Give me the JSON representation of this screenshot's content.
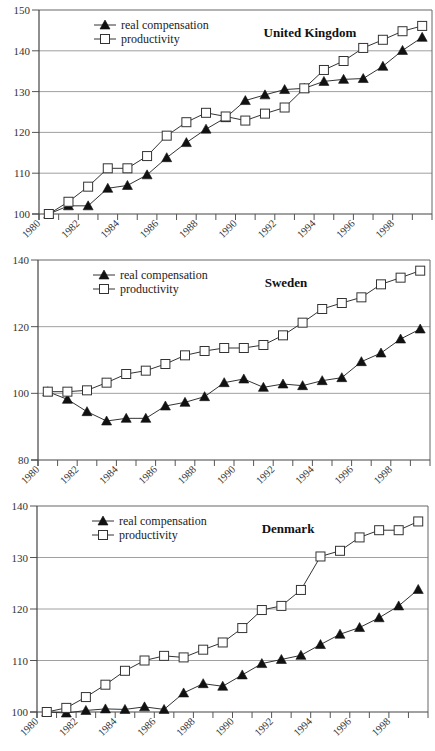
{
  "chart_data": [
    {
      "type": "line",
      "title": "United Kingdom",
      "xlabel": "",
      "ylabel": "",
      "ylim": [
        100,
        150
      ],
      "yticks": [
        100,
        110,
        120,
        130,
        140,
        150
      ],
      "xticks": [
        "1980",
        "1982",
        "1984",
        "1986",
        "1988",
        "1990",
        "1992",
        "1994",
        "1996",
        "1998"
      ],
      "grid": "horizontal",
      "legend_position": "top-left",
      "x": [
        1980,
        1981,
        1982,
        1983,
        1984,
        1985,
        1986,
        1987,
        1988,
        1989,
        1990,
        1991,
        1992,
        1993,
        1994,
        1995,
        1996,
        1997,
        1998,
        1999
      ],
      "series": [
        {
          "name": "real compensation",
          "marker": "filled-triangle",
          "values": [
            100,
            102,
            102,
            106.3,
            107,
            109.6,
            113.8,
            117.5,
            120.8,
            123.6,
            127.8,
            129.2,
            130.5,
            130.8,
            132.5,
            133,
            133.2,
            136.2,
            140.1,
            143.3
          ]
        },
        {
          "name": "productivity",
          "marker": "open-square",
          "values": [
            100,
            103,
            106.7,
            111.2,
            111.2,
            114.2,
            119.2,
            122.5,
            124.8,
            123.9,
            122.9,
            124.6,
            126.1,
            130.8,
            135.3,
            137.5,
            140.7,
            142.7,
            144.8,
            146.1
          ]
        }
      ]
    },
    {
      "type": "line",
      "title": "Sweden",
      "xlabel": "",
      "ylabel": "",
      "ylim": [
        80,
        140
      ],
      "yticks": [
        80,
        100,
        120,
        140
      ],
      "xticks": [
        "1980",
        "1982",
        "1984",
        "1986",
        "1988",
        "1990",
        "1992",
        "1994",
        "1996",
        "1998"
      ],
      "grid": "horizontal",
      "legend_position": "top-left",
      "x": [
        1980,
        1981,
        1982,
        1983,
        1984,
        1985,
        1986,
        1987,
        1988,
        1989,
        1990,
        1991,
        1992,
        1993,
        1994,
        1995,
        1996,
        1997,
        1998,
        1999
      ],
      "series": [
        {
          "name": "real compensation",
          "marker": "filled-triangle",
          "values": [
            100.5,
            98.2,
            94.5,
            91.7,
            92.5,
            92.5,
            96.2,
            97.3,
            99,
            103.2,
            104.3,
            101.8,
            102.8,
            102.3,
            103.8,
            104.7,
            109.5,
            112.1,
            116.3,
            119.3
          ]
        },
        {
          "name": "productivity",
          "marker": "open-square",
          "values": [
            100.5,
            100.5,
            100.9,
            103.2,
            105.8,
            106.8,
            108.8,
            111.4,
            112.7,
            113.6,
            113.6,
            114.5,
            117.4,
            121.2,
            125.3,
            127.1,
            128.8,
            132.7,
            134.7,
            136.8
          ]
        }
      ]
    },
    {
      "type": "line",
      "title": "Denmark",
      "xlabel": "",
      "ylabel": "",
      "ylim": [
        100,
        140
      ],
      "yticks": [
        100,
        110,
        120,
        130,
        140
      ],
      "xticks": [
        "1980",
        "1982",
        "1984",
        "1986",
        "1988",
        "1990",
        "1992",
        "1994",
        "1996",
        "1998"
      ],
      "grid": "horizontal",
      "legend_position": "top-left",
      "x": [
        1980,
        1981,
        1982,
        1983,
        1984,
        1985,
        1986,
        1987,
        1988,
        1989,
        1990,
        1991,
        1992,
        1993,
        1994,
        1995,
        1996,
        1997,
        1998,
        1999
      ],
      "series": [
        {
          "name": "real compensation",
          "marker": "filled-triangle",
          "values": [
            100,
            99.8,
            100.3,
            100.6,
            100.5,
            101,
            100.5,
            103.7,
            105.5,
            105,
            107.2,
            109.4,
            110.2,
            111,
            113.1,
            115.1,
            116.4,
            118.3,
            120.6,
            123.8
          ]
        },
        {
          "name": "productivity",
          "marker": "open-square",
          "values": [
            100,
            100.8,
            102.9,
            105.3,
            108,
            110,
            110.9,
            110.6,
            112.1,
            113.5,
            116.3,
            119.8,
            120.6,
            123.7,
            130.2,
            131.3,
            133.9,
            135.3,
            135.3,
            137
          ]
        }
      ]
    }
  ]
}
